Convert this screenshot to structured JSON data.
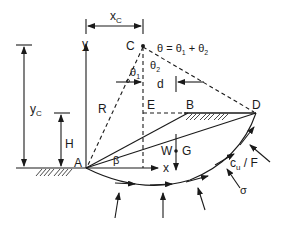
{
  "diagram": {
    "type": "slope-stability-circular-failure",
    "colors": {
      "ink": "#1a1a1a",
      "background": "#ffffff"
    },
    "points": {
      "A": "A",
      "B": "B",
      "C": "C",
      "D": "D",
      "E": "E",
      "G": "G"
    },
    "dimensions": {
      "xc": "x",
      "xc_sub": "C",
      "yc": "y",
      "yc_sub": "C",
      "H": "H",
      "d": "d",
      "R": "R"
    },
    "axes": {
      "x": "x",
      "y": "y"
    },
    "angles": {
      "beta": "β",
      "theta1": "θ",
      "theta1_sub": "1",
      "theta2": "θ",
      "theta2_sub": "2",
      "theta_equation": "θ = θ",
      "theta_eq_sub1": "1",
      "theta_eq_plus": " + θ",
      "theta_eq_sub2": "2"
    },
    "forces": {
      "W": "W",
      "cu_over_F": "c",
      "cu_sub": "u",
      "cu_tail": " / F",
      "sigma": "σ"
    }
  }
}
